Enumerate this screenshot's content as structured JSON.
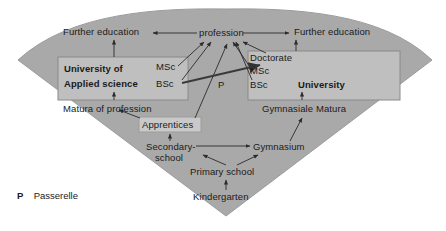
{
  "diagram": {
    "legend": {
      "symbol": "P",
      "text": "Passerelle"
    },
    "colors": {
      "fan_fill": "#a9a9a9",
      "box_fill": "#c0c0c0",
      "box_stroke": "#8a8a8a",
      "arrow": "#2b2b2b",
      "text": "#1a1a1a",
      "page_bg": "#ffffff"
    },
    "nodes": [
      {
        "id": "further-education-left",
        "label": "Further education",
        "style": "plain"
      },
      {
        "id": "profession",
        "label": "profession",
        "style": "plain"
      },
      {
        "id": "further-education-right",
        "label": "Further education",
        "style": "plain"
      },
      {
        "id": "university-of-applied-science",
        "label": "University of",
        "label2": "Applied science",
        "style": "box-bold"
      },
      {
        "id": "uas-msc",
        "label": "MSc",
        "style": "plain"
      },
      {
        "id": "uas-bsc",
        "label": "BSc",
        "style": "plain"
      },
      {
        "id": "passerelle-marker",
        "label": "P",
        "style": "plain"
      },
      {
        "id": "uni-doctorate",
        "label": "Doctorate",
        "style": "plain"
      },
      {
        "id": "uni-msc",
        "label": "MSc",
        "style": "plain"
      },
      {
        "id": "uni-bsc",
        "label": "BSc",
        "style": "plain"
      },
      {
        "id": "university",
        "label": "University",
        "style": "box-bold"
      },
      {
        "id": "matura-of-profession",
        "label": "Matura of profession",
        "style": "plain"
      },
      {
        "id": "gymnasiale-matura",
        "label": "Gymnasiale Matura",
        "style": "plain"
      },
      {
        "id": "apprentices",
        "label": "Apprentices",
        "style": "boxed"
      },
      {
        "id": "secondary-school",
        "label": "Secondary-",
        "label2": "school",
        "style": "plain"
      },
      {
        "id": "gymnasium",
        "label": "Gymnasium",
        "style": "plain"
      },
      {
        "id": "primary-school",
        "label": "Primary school",
        "style": "plain"
      },
      {
        "id": "kindergarten",
        "label": "Kindergarten",
        "style": "plain"
      }
    ],
    "edges": [
      {
        "from": "kindergarten",
        "to": "primary-school"
      },
      {
        "from": "primary-school",
        "to": "secondary-school"
      },
      {
        "from": "primary-school",
        "to": "gymnasium"
      },
      {
        "from": "secondary-school",
        "to": "gymnasium"
      },
      {
        "from": "secondary-school",
        "to": "apprentices"
      },
      {
        "from": "gymnasium",
        "to": "gymnasiale-matura"
      },
      {
        "from": "apprentices",
        "to": "matura-of-profession"
      },
      {
        "from": "apprentices",
        "to": "profession"
      },
      {
        "from": "matura-of-profession",
        "to": "university-of-applied-science"
      },
      {
        "from": "gymnasiale-matura",
        "to": "university"
      },
      {
        "from": "uas-msc",
        "to": "profession"
      },
      {
        "from": "uas-bsc",
        "to": "profession"
      },
      {
        "from": "uni-bsc",
        "to": "profession"
      },
      {
        "from": "uni-msc",
        "to": "profession"
      },
      {
        "from": "uni-doctorate",
        "to": "profession"
      },
      {
        "from": "uas-bsc",
        "to": "uni-msc",
        "note": "Passerelle P"
      },
      {
        "from": "profession",
        "to": "further-education-left"
      },
      {
        "from": "profession",
        "to": "further-education-right"
      },
      {
        "from": "university-of-applied-science",
        "to": "further-education-left"
      },
      {
        "from": "university",
        "to": "further-education-right"
      }
    ]
  }
}
